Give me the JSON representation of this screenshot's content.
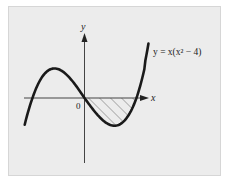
{
  "chart_data": {
    "type": "line",
    "title": "",
    "function": "y = x(x^2 - 4)",
    "annotation": "y = x(x² − 4)",
    "xlabel": "x",
    "ylabel": "y",
    "origin_label": "0",
    "x_range": [
      -2.3,
      2.46
    ],
    "roots": [
      -2,
      0,
      2
    ],
    "local_max": {
      "x": -1.155,
      "y": 3.08
    },
    "local_min": {
      "x": 1.155,
      "y": -3.08
    },
    "shaded_region": {
      "from_x": 0,
      "to_x": 2,
      "between": "curve and x-axis",
      "style": "hatched"
    },
    "grid": false,
    "series": [
      {
        "name": "y = x(x^2 - 4)",
        "x": [
          -2.3,
          -2.0,
          -1.5,
          -1.155,
          -1.0,
          -0.5,
          0,
          0.5,
          1.0,
          1.155,
          1.5,
          2.0,
          2.3,
          2.46
        ],
        "values": [
          -2.97,
          0,
          2.63,
          3.08,
          3.0,
          1.88,
          0,
          -1.88,
          -3.0,
          -3.08,
          -2.63,
          0,
          2.97,
          5.04
        ]
      }
    ]
  },
  "colors": {
    "panel": "#ececec",
    "curve": "#1a1a1a",
    "axis": "#444444",
    "hatch": "#8a8a8a"
  }
}
